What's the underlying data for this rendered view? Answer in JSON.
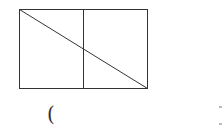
{
  "diagram": {
    "rectangle": {
      "x": 19,
      "y": 9,
      "width": 128,
      "height": 79
    },
    "divider_x": 83,
    "diagonal": {
      "from": "top-left",
      "to": "bottom-right"
    },
    "stroke_color": "#333333"
  },
  "answer_blank": {
    "open_paren": "("
  },
  "right_marks": [
    {
      "y": 107
    },
    {
      "y": 124
    }
  ]
}
